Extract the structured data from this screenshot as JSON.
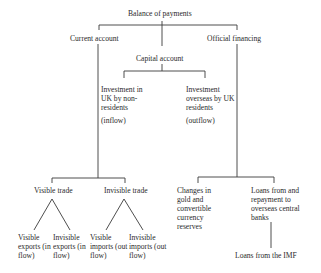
{
  "diagram": {
    "root": "Balance of payments",
    "current_account": "Current account",
    "capital_account": "Capital account",
    "official_financing": "Official financing",
    "investment_in_uk": "Investment in UK by non-residents",
    "inflow": "(inflow)",
    "investment_overseas": "Investment overseas by UK residents",
    "outflow": "(outflow)",
    "visible_trade": "Visible trade",
    "invisible_trade": "Invisible trade",
    "visible_exports": "Visible exports (in flow)",
    "invisible_exports": "Invisible exports (in flow)",
    "visible_imports": "Visible imports (out flow)",
    "invisible_imports": "Invisible imports (out flow)",
    "changes_in_gold": "Changes in gold and convertible currency reserves",
    "loans_repayment": "Loans from and repayment to overseas central banks",
    "loans_imf": "Loans from the IMF"
  }
}
